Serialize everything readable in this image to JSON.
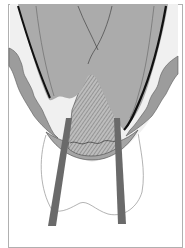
{
  "figure": {
    "type": "dental cross-section illustration",
    "text_labels": [],
    "colors": {
      "background": "#ffffff",
      "frame": "#9a9a9a",
      "crown_fill": "#a9a9a9",
      "crown_outline": "#111111",
      "gingiva_fill": "#9b9b9b",
      "gingiva_light": "#eeeeee",
      "hatch_fill": "#b8b8b8",
      "hatch_line": "#6e6e6e",
      "root_outline": "#9a9a9a",
      "instrument_fill": "#6a6a6a"
    },
    "elements": [
      "crown",
      "enamel-outline",
      "fissure-lines",
      "gingiva-left",
      "gingiva-right",
      "hatched-restoration",
      "root-outline",
      "instrument-left",
      "instrument-right",
      "frame"
    ]
  }
}
